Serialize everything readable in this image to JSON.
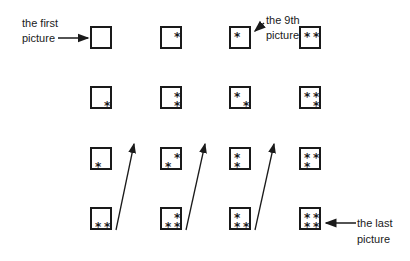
{
  "labels": {
    "first_line1": "the first",
    "first_line2": "picture",
    "ninth_line1": "the 9th",
    "ninth_line2": "picture",
    "last_line1": "the last",
    "last_line2": "picture"
  },
  "star_glyph": "*",
  "grid": {
    "columns": 4,
    "rows": 4,
    "order": "column-major, top to bottom, then next column",
    "pictures": [
      {
        "index": 1,
        "col": 1,
        "row": 1,
        "stars": []
      },
      {
        "index": 2,
        "col": 1,
        "row": 2,
        "stars": [
          "bottom-right"
        ]
      },
      {
        "index": 3,
        "col": 1,
        "row": 3,
        "stars": [
          "bottom-left"
        ]
      },
      {
        "index": 4,
        "col": 1,
        "row": 4,
        "stars": [
          "bottom-left",
          "bottom-right"
        ]
      },
      {
        "index": 5,
        "col": 2,
        "row": 1,
        "stars": [
          "top-right"
        ]
      },
      {
        "index": 6,
        "col": 2,
        "row": 2,
        "stars": [
          "top-right",
          "bottom-right"
        ]
      },
      {
        "index": 7,
        "col": 2,
        "row": 3,
        "stars": [
          "top-right",
          "bottom-left"
        ]
      },
      {
        "index": 8,
        "col": 2,
        "row": 4,
        "stars": [
          "top-right",
          "bottom-left",
          "bottom-right"
        ]
      },
      {
        "index": 9,
        "col": 3,
        "row": 1,
        "stars": [
          "top-left"
        ]
      },
      {
        "index": 10,
        "col": 3,
        "row": 2,
        "stars": [
          "top-left",
          "bottom-right"
        ]
      },
      {
        "index": 11,
        "col": 3,
        "row": 3,
        "stars": [
          "top-left",
          "bottom-left"
        ]
      },
      {
        "index": 12,
        "col": 3,
        "row": 4,
        "stars": [
          "top-left",
          "bottom-left",
          "bottom-right"
        ]
      },
      {
        "index": 13,
        "col": 4,
        "row": 1,
        "stars": [
          "top-left",
          "top-right"
        ]
      },
      {
        "index": 14,
        "col": 4,
        "row": 2,
        "stars": [
          "top-left",
          "top-right",
          "bottom-right"
        ]
      },
      {
        "index": 15,
        "col": 4,
        "row": 3,
        "stars": [
          "top-left",
          "top-right",
          "bottom-left"
        ]
      },
      {
        "index": 16,
        "col": 4,
        "row": 4,
        "stars": [
          "top-left",
          "top-right",
          "bottom-left",
          "bottom-right"
        ]
      }
    ]
  },
  "colors": {
    "ink": "#1a1a1a",
    "background": "#ffffff"
  }
}
